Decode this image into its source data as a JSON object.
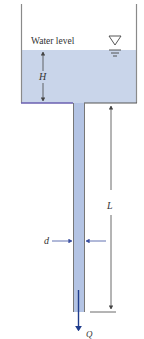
{
  "diagram": {
    "type": "tank-with-drain-pipe",
    "labels": {
      "water_level": "Water level",
      "head": "H",
      "pipe_length": "L",
      "pipe_diameter": "d",
      "flow_rate": "Q"
    },
    "symbols": {
      "free_surface": "inverted-triangle-free-surface-icon"
    },
    "colors": {
      "water": "#c9d5ea",
      "pipe_water": "#b4c4e4",
      "wall": "#8a8a8a",
      "tank_bottom": "#6a5fb0",
      "dimension_line": "#444444",
      "flow_arrow": "#1f3c8c",
      "d_arrows": "#3a4fa0",
      "background": "#ffffff"
    }
  }
}
